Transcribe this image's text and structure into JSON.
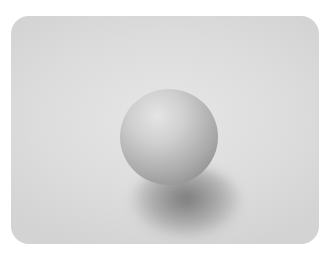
{
  "scene": {
    "description": "Photograph of a single matte sphere resting on a light gray surface, casting a soft shadow below, framed in a rounded rectangle",
    "colors": {
      "background": "#ffffff",
      "surface": "#dcdcdc",
      "sphere_highlight": "#e4e4e4",
      "sphere_shade": "#8f8f8f",
      "shadow": "#5a5a5a"
    }
  }
}
